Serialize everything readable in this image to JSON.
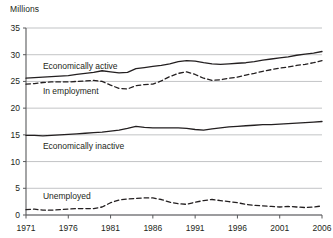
{
  "chart_data": {
    "type": "line",
    "title": "",
    "subtitle": "",
    "ylabel": "Millions",
    "xlabel": "",
    "ylim": [
      0,
      35
    ],
    "xlim": [
      1971,
      2006
    ],
    "yticks": [
      0,
      5,
      10,
      15,
      20,
      25,
      30,
      35
    ],
    "xticks": [
      1971,
      1976,
      1981,
      1986,
      1991,
      1996,
      2001,
      2006
    ],
    "grid": "horizontal",
    "legend_position": "inline-annotations",
    "x": [
      1971,
      1972,
      1973,
      1974,
      1975,
      1976,
      1977,
      1978,
      1979,
      1980,
      1981,
      1982,
      1983,
      1984,
      1985,
      1986,
      1987,
      1988,
      1989,
      1990,
      1991,
      1992,
      1993,
      1994,
      1995,
      1996,
      1997,
      1998,
      1999,
      2000,
      2001,
      2002,
      2003,
      2004,
      2005,
      2006
    ],
    "series": [
      {
        "name": "Economically active",
        "style": "solid",
        "color": "#231f20",
        "values": [
          25.6,
          25.7,
          25.8,
          25.9,
          26.0,
          26.1,
          26.3,
          26.5,
          26.7,
          27.0,
          26.8,
          26.6,
          26.7,
          27.4,
          27.6,
          27.8,
          28.0,
          28.3,
          28.7,
          28.9,
          28.8,
          28.5,
          28.3,
          28.2,
          28.3,
          28.4,
          28.5,
          28.7,
          29.0,
          29.2,
          29.4,
          29.6,
          29.9,
          30.1,
          30.3,
          30.6
        ]
      },
      {
        "name": "In employment",
        "style": "dashed",
        "color": "#231f20",
        "values": [
          24.5,
          24.6,
          24.8,
          24.9,
          24.9,
          24.9,
          25.0,
          25.1,
          25.2,
          25.0,
          24.3,
          23.7,
          23.6,
          24.2,
          24.4,
          24.5,
          25.1,
          25.9,
          26.5,
          26.8,
          26.3,
          25.6,
          25.2,
          25.3,
          25.6,
          25.8,
          26.2,
          26.5,
          26.9,
          27.2,
          27.5,
          27.7,
          28.0,
          28.2,
          28.5,
          28.9
        ]
      },
      {
        "name": "Economically inactive",
        "style": "solid",
        "color": "#231f20",
        "values": [
          14.9,
          14.9,
          14.8,
          14.9,
          15.0,
          15.1,
          15.2,
          15.3,
          15.4,
          15.5,
          15.7,
          15.9,
          16.2,
          16.6,
          16.4,
          16.3,
          16.3,
          16.3,
          16.3,
          16.2,
          16.0,
          15.9,
          16.1,
          16.3,
          16.5,
          16.6,
          16.7,
          16.8,
          16.9,
          16.9,
          17.0,
          17.1,
          17.2,
          17.3,
          17.4,
          17.5
        ]
      },
      {
        "name": "Unemployed",
        "style": "dashed",
        "color": "#231f20",
        "values": [
          1.0,
          1.1,
          0.9,
          0.9,
          1.0,
          1.1,
          1.2,
          1.2,
          1.2,
          1.5,
          2.3,
          2.8,
          3.0,
          3.1,
          3.2,
          3.2,
          2.9,
          2.4,
          2.1,
          2.0,
          2.4,
          2.7,
          2.9,
          2.7,
          2.5,
          2.3,
          2.0,
          1.8,
          1.7,
          1.6,
          1.5,
          1.6,
          1.5,
          1.4,
          1.5,
          1.7
        ]
      }
    ],
    "annotations": [
      {
        "text": "Economically active",
        "x": 1973.0,
        "y": 27.9
      },
      {
        "text": "In employment",
        "x": 1973.0,
        "y": 23.2
      },
      {
        "text": "Economically inactive",
        "x": 1973.0,
        "y": 13.0
      },
      {
        "text": "Unemployed",
        "x": 1973.0,
        "y": 3.5
      }
    ]
  }
}
